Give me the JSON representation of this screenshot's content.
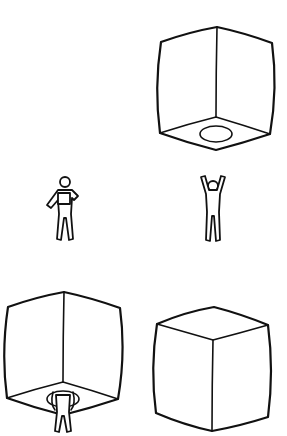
{
  "figure": {
    "panels": [
      {
        "id": "cube-from-below",
        "label": "cube viewed from below with opening",
        "has_opening": true
      },
      {
        "id": "figure-holding-box",
        "label": "person holding box at chest"
      },
      {
        "id": "figure-arms-raised",
        "label": "person with arms raised"
      },
      {
        "id": "cube-with-person-inside",
        "label": "cube with person standing in opening",
        "has_opening": true
      },
      {
        "id": "cube-from-above",
        "label": "cube viewed from above",
        "has_opening": false
      }
    ]
  },
  "colors": {
    "stroke": "#111111",
    "background": "#ffffff"
  }
}
